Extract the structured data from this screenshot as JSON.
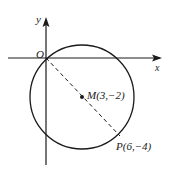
{
  "figure": {
    "axes": {
      "x_label": "x",
      "y_label": "y",
      "origin_label": "O"
    },
    "circle": {
      "center_label": "M(3,−2)",
      "center": [
        3,
        -2
      ],
      "radius_sq": 13
    },
    "point": {
      "label": "P(6,−4)",
      "coords": [
        6,
        -4
      ]
    },
    "segment": {
      "from": "O",
      "to": "P",
      "style": "dashed"
    },
    "colors": {
      "stroke": "#1a1a1a",
      "background": "#ffffff"
    }
  }
}
